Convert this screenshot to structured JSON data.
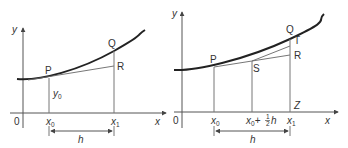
{
  "diagrams": [
    {
      "id": "trapezium-rule",
      "axis_labels": {
        "y": "y",
        "x": "x",
        "origin": "0"
      },
      "points": {
        "P": "P",
        "Q": "Q",
        "R": "R"
      },
      "ordinate_label": {
        "base": "y",
        "sub": "0"
      },
      "ticks": [
        {
          "base": "x",
          "sub": "0"
        },
        {
          "base": "x",
          "sub": "1"
        }
      ],
      "interval_label": "h"
    },
    {
      "id": "midpoint-rule",
      "axis_labels": {
        "y": "y",
        "x": "x",
        "origin": "0"
      },
      "points": {
        "P": "P",
        "Q": "Q",
        "T": "T",
        "R": "R",
        "S": "S",
        "Z": "Z"
      },
      "ticks": [
        {
          "base": "x",
          "sub": "0"
        },
        {
          "base": "x",
          "sub": "0",
          "suffix": "+",
          "frac_num": "1",
          "frac_den": "2",
          "tail": "h"
        },
        {
          "base": "x",
          "sub": "1"
        }
      ],
      "interval_label": "h"
    }
  ],
  "colors": {
    "curve": "#222222",
    "lines": "#666666",
    "text": "#333333"
  }
}
